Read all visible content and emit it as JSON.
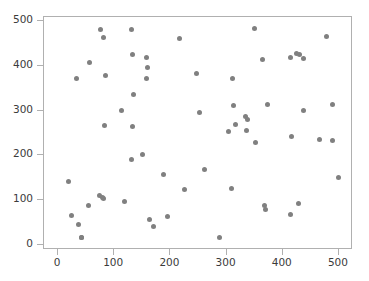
{
  "chart_data": {
    "type": "scatter",
    "title": "",
    "xlabel": "",
    "ylabel": "",
    "xlim": [
      -25,
      525
    ],
    "ylim": [
      -12,
      510
    ],
    "xticks": [
      0,
      100,
      200,
      300,
      400,
      500
    ],
    "yticks": [
      0,
      100,
      200,
      300,
      400,
      500
    ],
    "xticklabels": [
      "0",
      "100",
      "200",
      "300",
      "400",
      "500"
    ],
    "yticklabels": [
      "0",
      "100",
      "200",
      "300",
      "400",
      "500"
    ],
    "grid": false,
    "legend": null,
    "marker": {
      "shape": "circle",
      "color": "#808080",
      "size": 5,
      "count": 70
    },
    "points": [
      [
        18,
        141
      ],
      [
        24,
        66
      ],
      [
        32,
        373
      ],
      [
        37,
        46
      ],
      [
        41,
        16
      ],
      [
        42,
        17
      ],
      [
        54,
        88
      ],
      [
        56,
        407
      ],
      [
        74,
        109
      ],
      [
        75,
        481
      ],
      [
        79,
        105
      ],
      [
        81,
        104
      ],
      [
        81,
        465
      ],
      [
        82,
        268
      ],
      [
        84,
        379
      ],
      [
        113,
        301
      ],
      [
        118,
        96
      ],
      [
        131,
        481
      ],
      [
        131,
        190
      ],
      [
        132,
        427
      ],
      [
        133,
        264
      ],
      [
        134,
        337
      ],
      [
        150,
        203
      ],
      [
        157,
        373
      ],
      [
        158,
        419
      ],
      [
        160,
        396
      ],
      [
        162,
        57
      ],
      [
        170,
        40
      ],
      [
        188,
        157
      ],
      [
        194,
        64
      ],
      [
        216,
        462
      ],
      [
        225,
        123
      ],
      [
        246,
        384
      ],
      [
        251,
        296
      ],
      [
        261,
        169
      ],
      [
        287,
        17
      ],
      [
        303,
        253
      ],
      [
        308,
        125
      ],
      [
        310,
        372
      ],
      [
        313,
        311
      ],
      [
        316,
        270
      ],
      [
        334,
        286
      ],
      [
        335,
        256
      ],
      [
        337,
        281
      ],
      [
        350,
        484
      ],
      [
        352,
        229
      ],
      [
        364,
        414
      ],
      [
        368,
        88
      ],
      [
        369,
        78
      ],
      [
        373,
        313
      ],
      [
        413,
        420
      ],
      [
        414,
        68
      ],
      [
        415,
        242
      ],
      [
        425,
        428
      ],
      [
        428,
        93
      ],
      [
        429,
        425
      ],
      [
        436,
        417
      ],
      [
        437,
        301
      ],
      [
        465,
        236
      ],
      [
        478,
        467
      ],
      [
        488,
        233
      ],
      [
        489,
        315
      ],
      [
        500,
        151
      ]
    ]
  },
  "figure": {
    "background": "#ffffff",
    "axes_color": "#b0b0b0",
    "tick_label_color": "#3b3b3b"
  }
}
